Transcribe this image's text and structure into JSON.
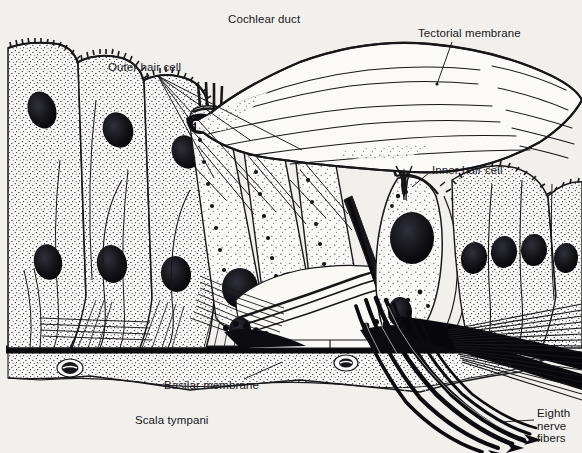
{
  "figure": {
    "background_color": "#f1f0ed",
    "ink_color": "#17171a",
    "width": 582,
    "height": 453
  },
  "labels": {
    "cochlear_duct": "Cochlear duct",
    "outer_hair_cell": "Outer hair cell",
    "tectorial_membrane": "Tectorial membrane",
    "inner_hair_cell": "Inner hair cell",
    "basilar_membrane": "Basilar membrane",
    "scala_tympani": "Scala tympani",
    "eighth_nerve_fibers": "Eighth nerve fibers"
  }
}
